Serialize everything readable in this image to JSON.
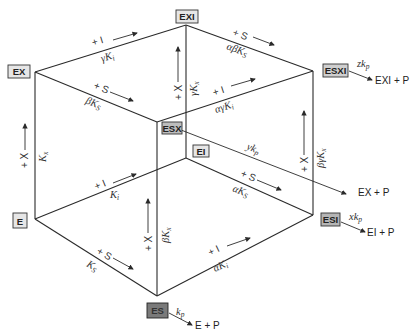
{
  "diagram": {
    "type": "kinetic cube scheme",
    "species": {
      "E": "E",
      "EX": "EX",
      "EXI": "EXI",
      "ESX": "ESX",
      "ESXI": "ESXI",
      "EI": "EI",
      "ESI": "ESI",
      "ES": "ES"
    },
    "edges": {
      "ex_exi": {
        "reagent": "+ I",
        "constant": "γK",
        "sub": "i"
      },
      "exi_esxi": {
        "reagent": "+ S",
        "constant": "αβK",
        "sub": "S"
      },
      "ex_esx": {
        "reagent": "+ S",
        "constant": "βK",
        "sub": "S"
      },
      "esx_esxi": {
        "reagent": "+ I",
        "constant": "αγK",
        "sub": "i"
      },
      "e_ex": {
        "reagent": "+ X",
        "constant": "K",
        "sub": "x"
      },
      "ei_exi": {
        "reagent": "+ X",
        "constant": "γK",
        "sub": "x"
      },
      "esi_esxi": {
        "reagent": "+ X",
        "constant": "βγK",
        "sub": "x"
      },
      "es_esx": {
        "reagent": "+ X",
        "constant": "βK",
        "sub": "x"
      },
      "e_ei": {
        "reagent": "+ I",
        "constant": "K",
        "sub": "i"
      },
      "ei_esi": {
        "reagent": "+ S",
        "constant": "αK",
        "sub": "S"
      },
      "e_es": {
        "reagent": "+ S",
        "constant": "K",
        "sub": "S"
      },
      "es_esi": {
        "reagent": "+ I",
        "constant": "αK",
        "sub": "i"
      }
    },
    "catalysis": {
      "esxi": {
        "rate": "zk",
        "sub": "p",
        "product": "EXI + P"
      },
      "esx": {
        "rate": "yk",
        "sub": "p",
        "product": "EX + P"
      },
      "esi": {
        "rate": "xk",
        "sub": "p",
        "product": "EI + P"
      },
      "es": {
        "rate": "k",
        "sub": "p",
        "product": "E + P"
      }
    }
  }
}
